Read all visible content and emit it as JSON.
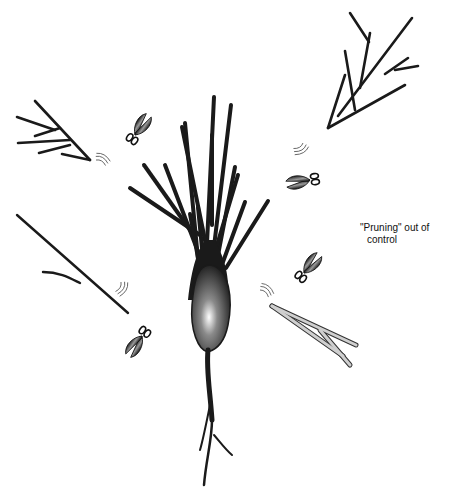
{
  "figure": {
    "annotation": {
      "line1": "\"Pruning\" out of",
      "line2": "control"
    },
    "elements": {
      "neuron": "pyramidal-neuron",
      "scissors_count": 5,
      "detached_dendrite_fragments": 5,
      "faded_fragment": "light-gray-branch"
    },
    "colors": {
      "ink": "#1a1a1a",
      "soma_highlight": "#ffffff",
      "faded_branch": "#bdbdbd",
      "background": "#ffffff"
    }
  }
}
